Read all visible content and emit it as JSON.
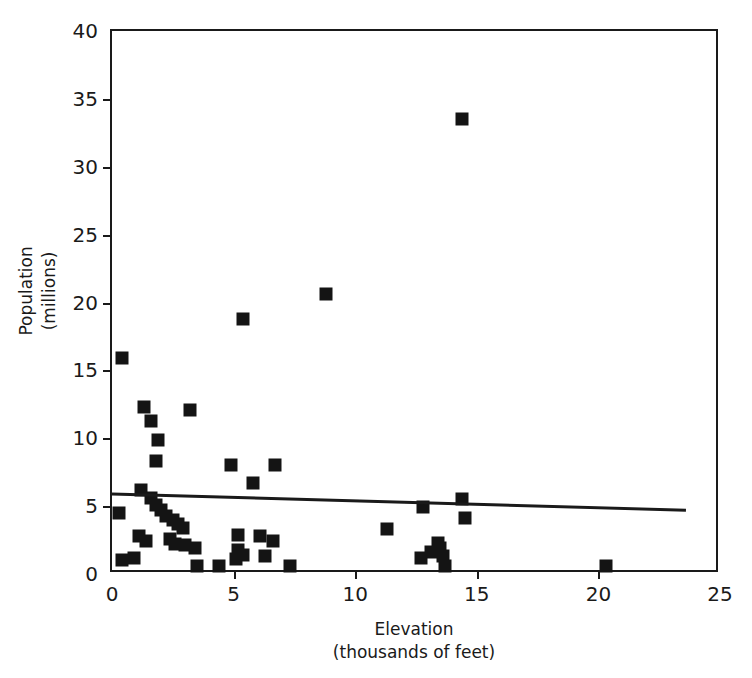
{
  "chart_data": {
    "type": "scatter",
    "title": "",
    "xlabel": "Elevation",
    "xlabel_sub": "(thousands of feet)",
    "ylabel": "Population",
    "ylabel_sub": "(millions)",
    "xlim": [
      0,
      25
    ],
    "ylim": [
      0,
      40
    ],
    "xticks": [
      0,
      5,
      10,
      15,
      20,
      25
    ],
    "yticks": [
      0,
      5,
      10,
      15,
      20,
      25,
      30,
      35,
      40
    ],
    "xtick_labels": [
      "0",
      "5",
      "10",
      "15",
      "20",
      "25"
    ],
    "ytick_labels": [
      "0",
      "5",
      "10",
      "15",
      "20",
      "25",
      "30",
      "35",
      "40"
    ],
    "grid": false,
    "legend": null,
    "marker_style": "filled-square",
    "marker_color": "#141414",
    "axis_color": "#1a1a1a",
    "background_color": "#ffffff",
    "points": [
      {
        "x": 0.4,
        "y": 15.9
      },
      {
        "x": 0.3,
        "y": 4.5
      },
      {
        "x": 0.4,
        "y": 1.0
      },
      {
        "x": 0.9,
        "y": 1.2
      },
      {
        "x": 1.3,
        "y": 12.3
      },
      {
        "x": 1.6,
        "y": 11.3
      },
      {
        "x": 1.9,
        "y": 9.9
      },
      {
        "x": 1.8,
        "y": 8.3
      },
      {
        "x": 1.2,
        "y": 6.2
      },
      {
        "x": 1.6,
        "y": 5.6
      },
      {
        "x": 1.8,
        "y": 5.1
      },
      {
        "x": 2.0,
        "y": 4.7
      },
      {
        "x": 2.2,
        "y": 4.3
      },
      {
        "x": 2.5,
        "y": 4.0
      },
      {
        "x": 2.7,
        "y": 3.7
      },
      {
        "x": 2.9,
        "y": 3.4
      },
      {
        "x": 1.1,
        "y": 2.8
      },
      {
        "x": 1.4,
        "y": 2.4
      },
      {
        "x": 2.4,
        "y": 2.6
      },
      {
        "x": 2.6,
        "y": 2.2
      },
      {
        "x": 3.0,
        "y": 2.1
      },
      {
        "x": 3.2,
        "y": 12.1
      },
      {
        "x": 3.4,
        "y": 1.9
      },
      {
        "x": 3.5,
        "y": 0.6
      },
      {
        "x": 4.4,
        "y": 0.6
      },
      {
        "x": 4.9,
        "y": 8.0
      },
      {
        "x": 5.4,
        "y": 18.8
      },
      {
        "x": 5.8,
        "y": 6.7
      },
      {
        "x": 5.2,
        "y": 2.9
      },
      {
        "x": 6.1,
        "y": 2.8
      },
      {
        "x": 5.1,
        "y": 1.1
      },
      {
        "x": 5.4,
        "y": 1.4
      },
      {
        "x": 5.2,
        "y": 1.8
      },
      {
        "x": 6.3,
        "y": 1.3
      },
      {
        "x": 6.7,
        "y": 8.0
      },
      {
        "x": 6.6,
        "y": 2.4
      },
      {
        "x": 7.3,
        "y": 0.6
      },
      {
        "x": 8.8,
        "y": 20.6
      },
      {
        "x": 11.3,
        "y": 3.3
      },
      {
        "x": 12.8,
        "y": 4.9
      },
      {
        "x": 12.7,
        "y": 1.2
      },
      {
        "x": 13.1,
        "y": 1.6
      },
      {
        "x": 13.4,
        "y": 2.3
      },
      {
        "x": 13.5,
        "y": 1.9
      },
      {
        "x": 13.6,
        "y": 1.3
      },
      {
        "x": 13.7,
        "y": 0.6
      },
      {
        "x": 14.4,
        "y": 33.5
      },
      {
        "x": 14.4,
        "y": 5.5
      },
      {
        "x": 14.5,
        "y": 4.1
      },
      {
        "x": 20.3,
        "y": 0.6
      }
    ],
    "trend_line": {
      "visible": true,
      "x_start": 0.0,
      "y_start": 5.9,
      "x_end": 23.6,
      "y_end": 4.7,
      "color": "#1a1a1a"
    }
  }
}
